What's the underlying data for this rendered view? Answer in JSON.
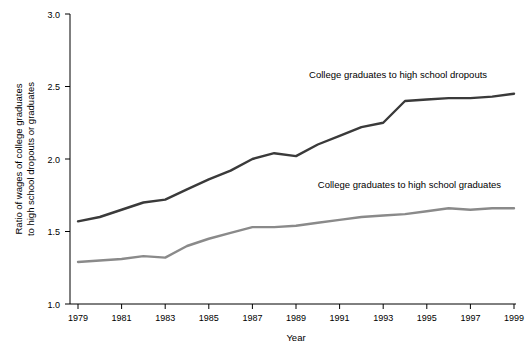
{
  "chart_data": {
    "type": "line",
    "title": "",
    "xlabel": "Year",
    "ylabel": "Ratio of wages of college graduates to high school dropouts or graduates",
    "ylabel_line1": "Ratio of wages of college graduates",
    "ylabel_line2": "to high school dropouts or graduates",
    "xlim": [
      1979,
      1999
    ],
    "ylim": [
      1.0,
      3.0
    ],
    "grid": false,
    "legend_position": "inline-annotations",
    "yticks": [
      "1.0",
      "1.5",
      "2.0",
      "2.5",
      "3.0"
    ],
    "ytick_values": [
      1.0,
      1.5,
      2.0,
      2.5,
      3.0
    ],
    "xticks": [
      "1979",
      "1981",
      "1983",
      "1985",
      "1987",
      "1989",
      "1991",
      "1993",
      "1995",
      "1997",
      "1999"
    ],
    "xtick_values": [
      1979,
      1981,
      1983,
      1985,
      1987,
      1989,
      1991,
      1993,
      1995,
      1997,
      1999
    ],
    "x": [
      1979,
      1980,
      1981,
      1982,
      1983,
      1984,
      1985,
      1986,
      1987,
      1988,
      1989,
      1990,
      1991,
      1992,
      1993,
      1994,
      1995,
      1996,
      1997,
      1998,
      1999
    ],
    "series": [
      {
        "name": "College graduates to high school dropouts",
        "color": "#3a3a3a",
        "values": [
          1.57,
          1.6,
          1.65,
          1.7,
          1.72,
          1.79,
          1.86,
          1.92,
          2.0,
          2.04,
          2.02,
          2.1,
          2.16,
          2.22,
          2.25,
          2.4,
          2.41,
          2.42,
          2.42,
          2.43,
          2.45
        ]
      },
      {
        "name": "College graduates to high school graduates",
        "color": "#8a8a8a",
        "values": [
          1.29,
          1.3,
          1.31,
          1.33,
          1.32,
          1.4,
          1.45,
          1.49,
          1.53,
          1.53,
          1.54,
          1.56,
          1.58,
          1.6,
          1.61,
          1.62,
          1.64,
          1.66,
          1.65,
          1.66,
          1.66
        ]
      }
    ],
    "annotations": [
      {
        "text": "College graduates to high school dropouts",
        "x": 1989.6,
        "y": 2.56
      },
      {
        "text": "College graduates to high school graduates",
        "x": 1990.0,
        "y": 1.8
      }
    ]
  }
}
